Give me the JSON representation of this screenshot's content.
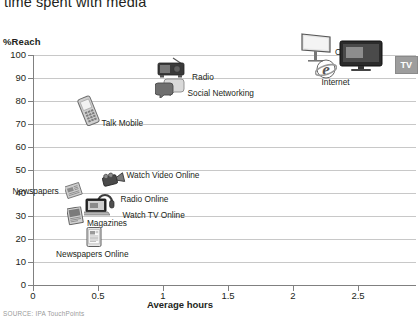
{
  "title": "time spent with media",
  "source_note": "SOURCE: IPA TouchPoints",
  "axes": {
    "y_title": "%Reach",
    "x_title": "Average hours",
    "y_ticks": [
      "0",
      "10",
      "20",
      "30",
      "40",
      "50",
      "60",
      "70",
      "80",
      "90",
      "100"
    ],
    "x_ticks": [
      "0",
      "0.5",
      "1",
      "1.5",
      "2",
      "2.5"
    ]
  },
  "colors": {
    "gridline": "#c8c8c8",
    "axis": "#808080",
    "text": "#231f20",
    "source_text": "#9a9a9a",
    "tv_badge_bg": "#9d9d9d"
  },
  "labels": {
    "ooh": "OOH",
    "tv": "TV",
    "internet": "Internet",
    "radio": "Radio",
    "social_networking": "Social Networking",
    "talk_mobile": "Talk Mobile",
    "watch_video_online": "Watch Video Online",
    "newspapers": "Newspapers",
    "radio_online": "Radio Online",
    "watch_tv_online": "Watch TV Online",
    "magazines": "Magazines",
    "newspapers_online": "Newspapers Online"
  },
  "chart_data": {
    "type": "scatter",
    "title": "time spent with media",
    "xlabel": "Average hours",
    "ylabel": "%Reach",
    "xlim": [
      0,
      2.8
    ],
    "ylim": [
      0,
      100
    ],
    "grid": true,
    "legend": "none",
    "marker_style": "device-photo-icons",
    "points": [
      {
        "label": "OOH",
        "x": 2.2,
        "y": 100,
        "icon": "billboard-icon"
      },
      {
        "label": "TV",
        "x": 2.55,
        "y": 98,
        "icon": "television-icon"
      },
      {
        "label": "Internet",
        "x": 2.25,
        "y": 93,
        "icon": "internet-explorer-icon"
      },
      {
        "label": "Radio",
        "x": 1.07,
        "y": 92,
        "icon": "radio-icon"
      },
      {
        "label": "Social Networking",
        "x": 1.05,
        "y": 85,
        "icon": "speech-bubbles-icon"
      },
      {
        "label": "Talk Mobile",
        "x": 0.42,
        "y": 75,
        "icon": "mobile-phone-icon"
      },
      {
        "label": "Watch Video Online",
        "x": 0.62,
        "y": 45,
        "icon": "video-camera-icon"
      },
      {
        "label": "Newspapers",
        "x": 0.32,
        "y": 40,
        "icon": "newspaper-stack-icon"
      },
      {
        "label": "Radio Online",
        "x": 0.55,
        "y": 36,
        "icon": "headphones-icon"
      },
      {
        "label": "Watch TV Online",
        "x": 0.55,
        "y": 32,
        "icon": "laptop-icon"
      },
      {
        "label": "Magazines",
        "x": 0.33,
        "y": 29,
        "icon": "magazine-icon"
      },
      {
        "label": "Newspapers Online",
        "x": 0.47,
        "y": 20,
        "icon": "tablet-icon"
      }
    ]
  }
}
